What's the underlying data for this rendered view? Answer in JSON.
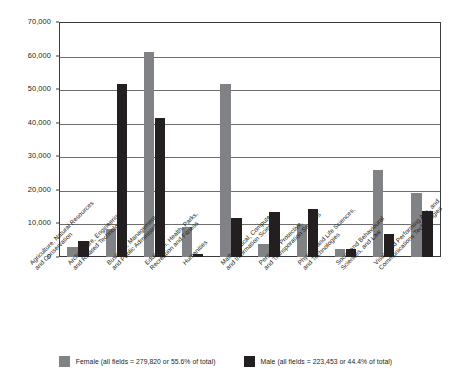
{
  "chart_data": {
    "type": "bar",
    "title": "",
    "xlabel": "",
    "ylabel": "",
    "ylim": [
      0,
      70000
    ],
    "ytick_step": 10000,
    "ytick_labels": [
      "70,000",
      "60,000",
      "50,000",
      "40,000",
      "30,000",
      "20,000",
      "10,000",
      "0"
    ],
    "ytick_values": [
      70000,
      60000,
      50000,
      40000,
      30000,
      20000,
      10000,
      0
    ],
    "grid": true,
    "legend_position": "bottom",
    "categories": [
      "Agriculture, Natural Resources\nand Conservation",
      "Architecture, Engineering\nand Related Technologies",
      "Business, Management\nand Public Administration",
      "Education, Health, Parks,\nRecreation and Fitness",
      "Humanities",
      "Mathematical, Computer,\nand Information Sciences",
      "Personal, Protective,\nand Transporation Services",
      "Physical and Life Sciences,\nand Technologies",
      "Social and Behavioural\nSciences, and Law",
      "Visual and Performing Arts, and\nCommunications Technologies"
    ],
    "series": [
      {
        "name": "Female",
        "color": "#808285",
        "legend_label": "Female (all fields = 279,820 or 55.6% of total)",
        "total": "279,820",
        "percent_of_total": "55.6%",
        "values": [
          2900,
          8200,
          61000,
          9000,
          51500,
          4000,
          9800,
          2300,
          26000,
          19000
        ]
      },
      {
        "name": "Male",
        "color": "#231f20",
        "legend_label": "Male (all fields = 223,453 or 44.4% of total)",
        "total": "223,453",
        "percent_of_total": "44.4%",
        "values": [
          4700,
          51500,
          41500,
          900,
          11700,
          13300,
          14400,
          2300,
          6800,
          13600
        ]
      }
    ]
  }
}
